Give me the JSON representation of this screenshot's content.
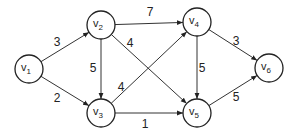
{
  "graph": {
    "type": "directed-weighted",
    "nodes": [
      {
        "id": "v1",
        "name": "v",
        "sub": "1",
        "x": 29,
        "y": 69
      },
      {
        "id": "v2",
        "name": "v",
        "sub": "2",
        "x": 101,
        "y": 25
      },
      {
        "id": "v3",
        "name": "v",
        "sub": "3",
        "x": 101,
        "y": 113
      },
      {
        "id": "v4",
        "name": "v",
        "sub": "4",
        "x": 197,
        "y": 22
      },
      {
        "id": "v5",
        "name": "v",
        "sub": "5",
        "x": 197,
        "y": 113
      },
      {
        "id": "v6",
        "name": "v",
        "sub": "6",
        "x": 269,
        "y": 68
      }
    ],
    "edges": [
      {
        "from": "v1",
        "to": "v2",
        "weight": "3",
        "lx": 57,
        "ly": 46
      },
      {
        "from": "v1",
        "to": "v3",
        "weight": "2",
        "lx": 57,
        "ly": 102
      },
      {
        "from": "v2",
        "to": "v3",
        "weight": "5",
        "lx": 93,
        "ly": 72
      },
      {
        "from": "v2",
        "to": "v4",
        "weight": "7",
        "lx": 150,
        "ly": 16
      },
      {
        "from": "v2",
        "to": "v5",
        "weight": "4",
        "lx": 130,
        "ly": 47
      },
      {
        "from": "v3",
        "to": "v4",
        "weight": "4",
        "lx": 121,
        "ly": 91
      },
      {
        "from": "v3",
        "to": "v5",
        "weight": "1",
        "lx": 145,
        "ly": 128
      },
      {
        "from": "v4",
        "to": "v5",
        "weight": "5",
        "lx": 202,
        "ly": 72
      },
      {
        "from": "v4",
        "to": "v6",
        "weight": "3",
        "lx": 236,
        "ly": 45
      },
      {
        "from": "v5",
        "to": "v6",
        "weight": "5",
        "lx": 236,
        "ly": 101
      }
    ]
  }
}
